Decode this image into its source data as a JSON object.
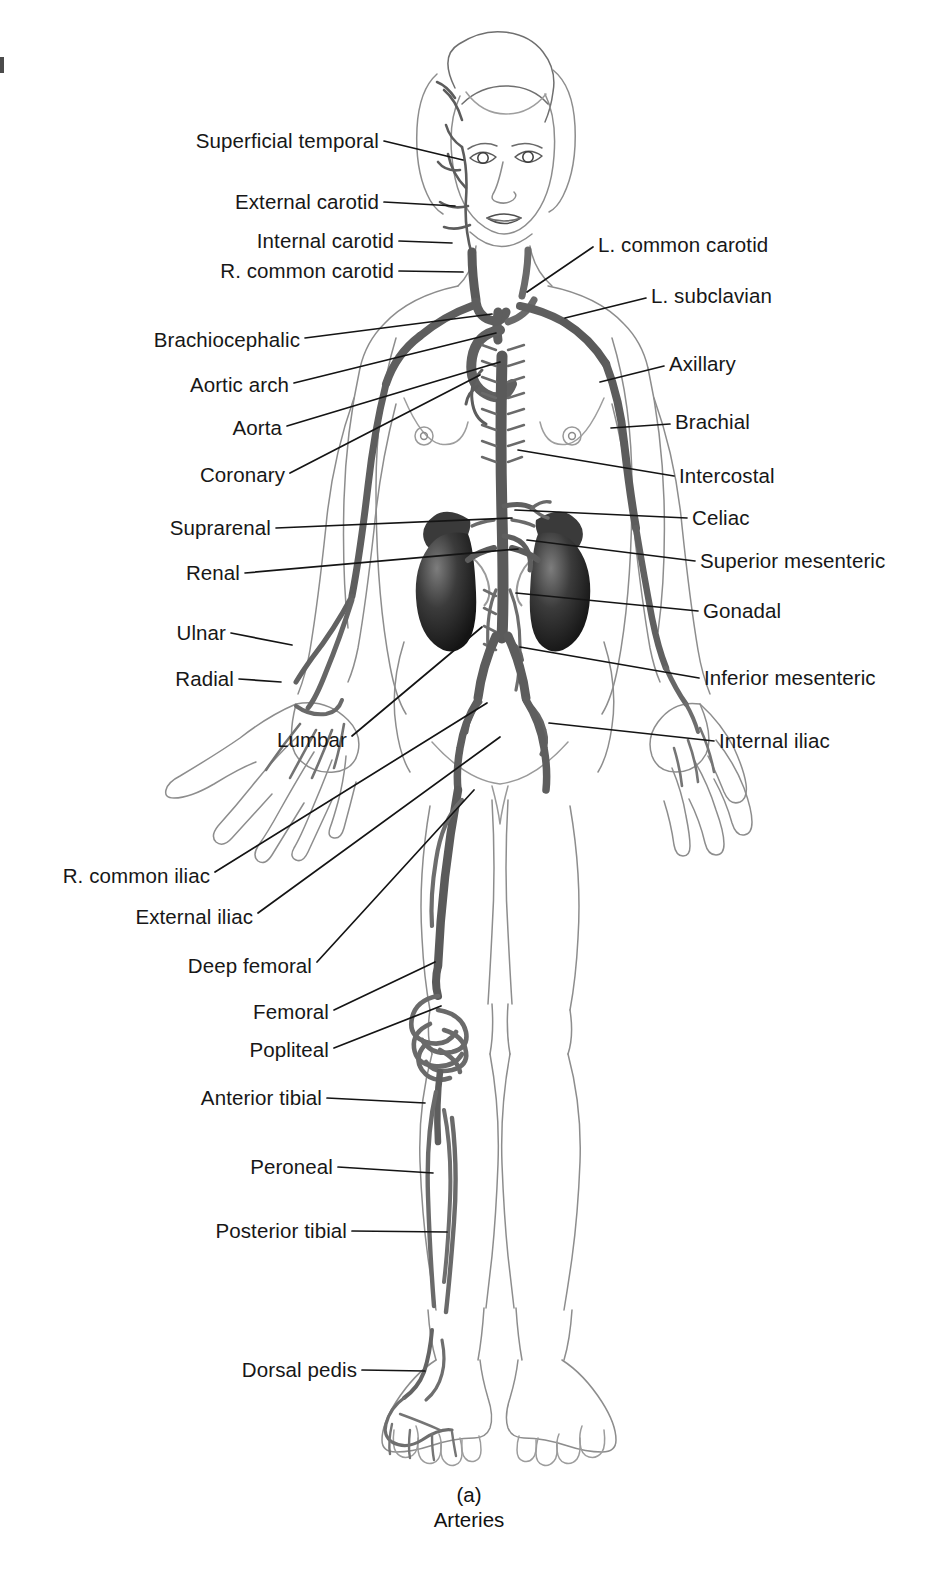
{
  "figure": {
    "caption_letter": "(a)",
    "caption_title": "Arteries",
    "colors": {
      "artery": "#6f6f6f",
      "artery_dark": "#4a4a4a",
      "outline": "#8d8d8d",
      "organ_dark": "#2e2e2e",
      "leader_line": "#141414",
      "text": "#171717",
      "background": "#ffffff"
    }
  },
  "labels_left": [
    {
      "text": "Superficial temporal",
      "x": 379,
      "y": 141,
      "tip_x": 463,
      "tip_y": 160
    },
    {
      "text": "External carotid",
      "x": 379,
      "y": 202,
      "tip_x": 455,
      "tip_y": 206
    },
    {
      "text": "Internal carotid",
      "x": 394,
      "y": 241,
      "tip_x": 452,
      "tip_y": 243
    },
    {
      "text": "R. common carotid",
      "x": 394,
      "y": 271,
      "tip_x": 463,
      "tip_y": 272
    },
    {
      "text": "Brachiocephalic",
      "x": 300,
      "y": 340,
      "tip_x": 492,
      "tip_y": 314
    },
    {
      "text": "Aortic arch",
      "x": 289,
      "y": 385,
      "tip_x": 496,
      "tip_y": 333
    },
    {
      "text": "Aorta",
      "x": 282,
      "y": 428,
      "tip_x": 500,
      "tip_y": 362
    },
    {
      "text": "Coronary",
      "x": 285,
      "y": 475,
      "tip_x": 480,
      "tip_y": 375
    },
    {
      "text": "Suprarenal",
      "x": 271,
      "y": 528,
      "tip_x": 512,
      "tip_y": 518
    },
    {
      "text": "Renal",
      "x": 240,
      "y": 573,
      "tip_x": 518,
      "tip_y": 549
    },
    {
      "text": "Ulnar",
      "x": 226,
      "y": 633,
      "tip_x": 292,
      "tip_y": 645
    },
    {
      "text": "Radial",
      "x": 234,
      "y": 679,
      "tip_x": 281,
      "tip_y": 682
    },
    {
      "text": "Lumbar",
      "x": 347,
      "y": 740,
      "tip_x": 482,
      "tip_y": 627
    },
    {
      "text": "R. common iliac",
      "x": 210,
      "y": 876,
      "tip_x": 487,
      "tip_y": 703
    },
    {
      "text": "External iliac",
      "x": 253,
      "y": 917,
      "tip_x": 500,
      "tip_y": 737
    },
    {
      "text": "Deep femoral",
      "x": 312,
      "y": 966,
      "tip_x": 474,
      "tip_y": 790
    },
    {
      "text": "Femoral",
      "x": 329,
      "y": 1012,
      "tip_x": 435,
      "tip_y": 962
    },
    {
      "text": "Popliteal",
      "x": 329,
      "y": 1050,
      "tip_x": 441,
      "tip_y": 1006
    },
    {
      "text": "Anterior tibial",
      "x": 322,
      "y": 1098,
      "tip_x": 425,
      "tip_y": 1103
    },
    {
      "text": "Peroneal",
      "x": 333,
      "y": 1167,
      "tip_x": 433,
      "tip_y": 1173
    },
    {
      "text": "Posterior tibial",
      "x": 347,
      "y": 1231,
      "tip_x": 447,
      "tip_y": 1232
    },
    {
      "text": "Dorsal pedis",
      "x": 357,
      "y": 1370,
      "tip_x": 425,
      "tip_y": 1371
    }
  ],
  "labels_right": [
    {
      "text": "L. common carotid",
      "x": 598,
      "y": 245,
      "tip_x": 527,
      "tip_y": 292
    },
    {
      "text": "L. subclavian",
      "x": 651,
      "y": 296,
      "tip_x": 565,
      "tip_y": 318
    },
    {
      "text": "Axillary",
      "x": 669,
      "y": 364,
      "tip_x": 600,
      "tip_y": 382
    },
    {
      "text": "Brachial",
      "x": 675,
      "y": 422,
      "tip_x": 611,
      "tip_y": 428
    },
    {
      "text": "Intercostal",
      "x": 679,
      "y": 476,
      "tip_x": 518,
      "tip_y": 450
    },
    {
      "text": "Celiac",
      "x": 692,
      "y": 518,
      "tip_x": 515,
      "tip_y": 510
    },
    {
      "text": "Superior mesenteric",
      "x": 700,
      "y": 561,
      "tip_x": 527,
      "tip_y": 540
    },
    {
      "text": "Gonadal",
      "x": 703,
      "y": 611,
      "tip_x": 516,
      "tip_y": 593
    },
    {
      "text": "Inferior mesenteric",
      "x": 704,
      "y": 678,
      "tip_x": 520,
      "tip_y": 647
    },
    {
      "text": "Internal iliac",
      "x": 719,
      "y": 741,
      "tip_x": 549,
      "tip_y": 723
    }
  ]
}
